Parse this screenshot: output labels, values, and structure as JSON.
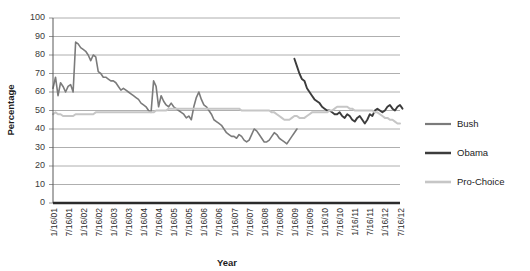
{
  "chart_data": {
    "type": "line",
    "title": "",
    "xlabel": "Year",
    "ylabel": "Percentage",
    "ylim": [
      0,
      100
    ],
    "ytick_step": 10,
    "yticks": [
      0,
      10,
      20,
      30,
      40,
      50,
      60,
      70,
      80,
      90,
      100
    ],
    "grid": true,
    "legend_position": "right",
    "xtick_labels": [
      "1/16/01",
      "7/16/01",
      "1/16/02",
      "7/16/02",
      "1/16/03",
      "7/16/03",
      "1/16/04",
      "7/16/04",
      "1/16/05",
      "7/16/05",
      "1/16/06",
      "7/16/06",
      "1/16/07",
      "7/16/07",
      "1/16/08",
      "7/16/08",
      "1/16/09",
      "7/16/09",
      "1/16/10",
      "7/16/10",
      "1/16/11",
      "7/16/11",
      "1/16/12",
      "7/16/12"
    ],
    "x_index_range": [
      0,
      138
    ],
    "x_tick_indices": [
      0,
      6,
      12,
      18,
      24,
      30,
      36,
      42,
      48,
      54,
      60,
      66,
      72,
      78,
      84,
      90,
      96,
      102,
      108,
      114,
      120,
      126,
      132,
      138
    ],
    "series": [
      {
        "name": "Bush",
        "color": "#7b7b7b",
        "stroke_width": 1.6,
        "start_index": 0,
        "values": [
          62,
          68,
          58,
          65,
          63,
          60,
          63,
          64,
          60,
          87,
          86,
          84,
          83,
          82,
          80,
          77,
          80,
          79,
          71,
          70,
          68,
          68,
          67,
          66,
          66,
          65,
          63,
          61,
          62,
          61,
          60,
          59,
          58,
          57,
          56,
          54,
          53,
          52,
          50,
          49,
          66,
          63,
          52,
          58,
          55,
          53,
          52,
          54,
          52,
          51,
          50,
          49,
          48,
          46,
          47,
          45,
          52,
          57,
          60,
          56,
          53,
          52,
          50,
          48,
          45,
          44,
          43,
          42,
          40,
          38,
          37,
          36,
          36,
          35,
          37,
          36,
          34,
          33,
          34,
          37,
          40,
          39,
          37,
          35,
          33,
          33,
          34,
          36,
          38,
          37,
          35,
          34,
          33,
          32,
          34,
          36,
          38,
          40
        ]
      },
      {
        "name": "Obama",
        "color": "#3c3c3c",
        "stroke_width": 1.9,
        "start_index": 96,
        "values": [
          78,
          74,
          70,
          67,
          66,
          62,
          60,
          58,
          56,
          55,
          54,
          52,
          51,
          50,
          50,
          49,
          48,
          48,
          49,
          47,
          46,
          48,
          47,
          45,
          44,
          46,
          47,
          45,
          43,
          45,
          48,
          47,
          50,
          51,
          50,
          49,
          50,
          52,
          53,
          51,
          50,
          52,
          53,
          51
        ]
      },
      {
        "name": "Pro-Choice",
        "color": "#c6c6c6",
        "stroke_width": 2.0,
        "start_index": 0,
        "values": [
          48,
          49,
          48,
          48,
          47,
          47,
          47,
          47,
          47,
          48,
          48,
          48,
          48,
          48,
          48,
          48,
          48,
          49,
          49,
          49,
          49,
          49,
          49,
          49,
          49,
          49,
          49,
          49,
          49,
          49,
          49,
          49,
          49,
          49,
          49,
          49,
          49,
          49,
          49,
          49,
          49,
          50,
          50,
          50,
          50,
          50,
          51,
          51,
          51,
          51,
          51,
          51,
          51,
          51,
          51,
          51,
          51,
          51,
          51,
          51,
          51,
          51,
          51,
          51,
          51,
          51,
          51,
          51,
          51,
          51,
          51,
          51,
          51,
          51,
          51,
          50,
          50,
          50,
          50,
          50,
          50,
          50,
          50,
          50,
          50,
          50,
          50,
          49,
          49,
          48,
          47,
          46,
          45,
          45,
          45,
          46,
          47,
          47,
          46,
          46,
          46,
          47,
          48,
          49,
          49,
          49,
          49,
          49,
          49,
          49,
          50,
          50,
          51,
          52,
          52,
          52,
          52,
          52,
          51,
          51,
          50,
          50,
          50,
          50,
          50,
          50,
          50,
          50,
          49,
          49,
          48,
          47,
          46,
          46,
          45,
          45,
          44,
          43,
          43
        ]
      }
    ]
  },
  "legend": {
    "items": [
      {
        "label": "Bush"
      },
      {
        "label": "Obama"
      },
      {
        "label": "Pro-Choice"
      }
    ]
  }
}
